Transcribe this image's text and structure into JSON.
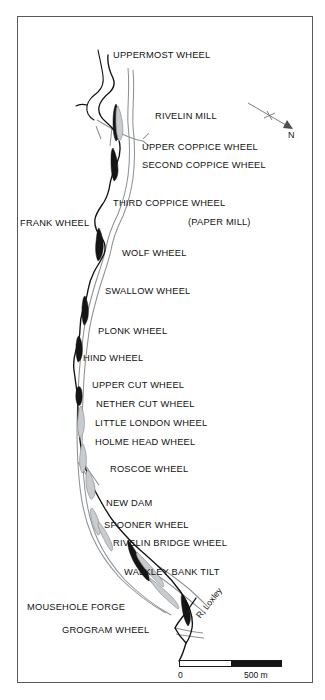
{
  "figure": {
    "type": "map",
    "river_label": "R. Loxley"
  },
  "compass": {
    "label": "N",
    "icon": "north-arrow-icon"
  },
  "scale": {
    "zero_label": "0",
    "max_label": "500 m",
    "segments": 2
  },
  "colors": {
    "frame": "#555a5e",
    "river": "#111111",
    "road": "#8d9296",
    "pond_fill": "#1a1a1a",
    "text": "#111111",
    "background": "#ffffff"
  },
  "site_labels": [
    {
      "id": "uppermost-wheel",
      "text": "UPPERMOST WHEEL",
      "x": 113,
      "y": 51
    },
    {
      "id": "rivelin-mill",
      "text": "RIVELIN MILL",
      "x": 155,
      "y": 112
    },
    {
      "id": "upper-coppice-wheel",
      "text": "UPPER COPPICE WHEEL",
      "x": 142,
      "y": 143
    },
    {
      "id": "second-coppice-wheel",
      "text": "SECOND COPPICE WHEEL",
      "x": 142,
      "y": 161
    },
    {
      "id": "third-coppice-wheel",
      "text": "THIRD COPPICE WHEEL",
      "x": 113,
      "y": 199
    },
    {
      "id": "paper-mill",
      "text": "(PAPER MILL)",
      "x": 188,
      "y": 218
    },
    {
      "id": "frank-wheel",
      "text": "FRANK WHEEL",
      "x": 20,
      "y": 219
    },
    {
      "id": "wolf-wheel",
      "text": "WOLF WHEEL",
      "x": 122,
      "y": 249
    },
    {
      "id": "swallow-wheel",
      "text": "SWALLOW WHEEL",
      "x": 105,
      "y": 287
    },
    {
      "id": "plonk-wheel",
      "text": "PLONK WHEEL",
      "x": 98,
      "y": 327
    },
    {
      "id": "hind-wheel",
      "text": "HIND WHEEL",
      "x": 83,
      "y": 354
    },
    {
      "id": "upper-cut-wheel",
      "text": "UPPER CUT WHEEL",
      "x": 92,
      "y": 381
    },
    {
      "id": "nether-cut-wheel",
      "text": "NETHER CUT WHEEL",
      "x": 96,
      "y": 400
    },
    {
      "id": "little-london-wheel",
      "text": "LITTLE LONDON WHEEL",
      "x": 95,
      "y": 419
    },
    {
      "id": "holme-head-wheel",
      "text": "HOLME HEAD WHEEL",
      "x": 95,
      "y": 438
    },
    {
      "id": "roscoe-wheel",
      "text": "ROSCOE WHEEL",
      "x": 110,
      "y": 465
    },
    {
      "id": "new-dam",
      "text": "NEW DAM",
      "x": 106,
      "y": 499
    },
    {
      "id": "spooner-wheel",
      "text": "SPOONER WHEEL",
      "x": 104,
      "y": 521
    },
    {
      "id": "rivelin-bridge-wheel",
      "text": "RIVELIN BRIDGE WHEEL",
      "x": 113,
      "y": 539
    },
    {
      "id": "walkley-bank-tilt",
      "text": "WALKLEY BANK TILT",
      "x": 124,
      "y": 568
    },
    {
      "id": "mousehole-forge",
      "text": "MOUSEHOLE FORGE",
      "x": 27,
      "y": 603
    },
    {
      "id": "grogram-wheel",
      "text": "GROGRAM WHEEL",
      "x": 62,
      "y": 626
    }
  ]
}
